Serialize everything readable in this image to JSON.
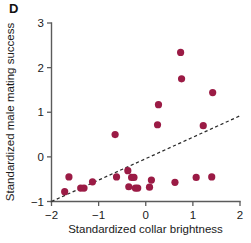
{
  "panel": {
    "label": "D"
  },
  "colors": {
    "marker": "#9B1B45",
    "axis": "#5b5b5b",
    "fit_line": "#2a2a2a",
    "text": "#1a1a1a",
    "background": "#ffffff"
  },
  "chart_data": {
    "type": "scatter",
    "title": "",
    "xlabel": "Standardized collar brightness",
    "ylabel": "Standardized male mating success",
    "xlim": [
      -2,
      2
    ],
    "ylim": [
      -1,
      3
    ],
    "xticks": [
      -2,
      -1,
      0,
      1,
      2
    ],
    "xticklabels": [
      "−2",
      "−1",
      "0",
      "1",
      "2"
    ],
    "yticks": [
      -1,
      0,
      1,
      2,
      3
    ],
    "yticklabels": [
      "−1",
      "0",
      "1",
      "2",
      "3"
    ],
    "grid": false,
    "legend": null,
    "series": [
      {
        "name": "males",
        "marker": "filled-circle",
        "color": "#9B1B45",
        "points": [
          [
            -1.72,
            -0.78
          ],
          [
            -1.63,
            -0.45
          ],
          [
            -1.38,
            -0.7
          ],
          [
            -1.31,
            -0.7
          ],
          [
            -1.13,
            -0.56
          ],
          [
            -0.65,
            0.5
          ],
          [
            -0.62,
            -0.45
          ],
          [
            -0.38,
            -0.31
          ],
          [
            -0.36,
            -0.67
          ],
          [
            -0.3,
            -0.46
          ],
          [
            -0.25,
            -0.46
          ],
          [
            -0.22,
            -0.7
          ],
          [
            -0.17,
            -0.7
          ],
          [
            0.08,
            -0.68
          ],
          [
            0.12,
            -0.52
          ],
          [
            0.27,
            1.17
          ],
          [
            0.25,
            0.72
          ],
          [
            0.62,
            -0.57
          ],
          [
            0.74,
            2.34
          ],
          [
            0.76,
            1.75
          ],
          [
            1.07,
            -0.46
          ],
          [
            1.22,
            0.7
          ],
          [
            1.4,
            -0.45
          ],
          [
            1.42,
            1.44
          ]
        ]
      }
    ],
    "trend_line": {
      "style": "dashed",
      "color": "#2a2a2a",
      "x_start": -2.0,
      "y_start": -1.0,
      "x_end": 2.0,
      "y_end": 0.92
    }
  }
}
